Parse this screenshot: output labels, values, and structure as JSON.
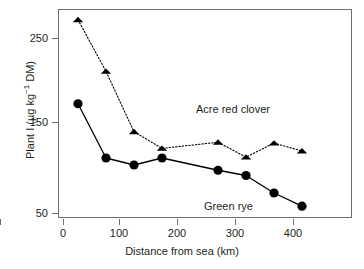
{
  "chart_data": {
    "type": "line",
    "title": "",
    "subtitle": "",
    "xlabel": "Distance from sea (km)",
    "ylabel": "Plant I (µg kg⁻¹ DM)",
    "ylabel_parts": {
      "prefix": "Plant I (µg kg",
      "superscript": "−1",
      "suffix": " DM)"
    },
    "xlim": [
      -15,
      440
    ],
    "ylim": [
      40,
      289
    ],
    "xticks": [
      0,
      100,
      200,
      300,
      400
    ],
    "xtick_labels": [
      "0",
      "100",
      "200",
      "300",
      "400"
    ],
    "yticks": [
      50,
      150,
      250
    ],
    "ytick_labels": [
      "50",
      "150",
      "250"
    ],
    "grid": false,
    "legend_position": "inline-annotations",
    "frame": "box",
    "series": [
      {
        "name": "Acre red clover",
        "marker": "triangle",
        "linestyle": "dotted",
        "color": "#000000",
        "annotation": "Acre red clover",
        "x": [
          25,
          75,
          125,
          175,
          275,
          325,
          375,
          425
        ],
        "values": [
          272,
          213,
          144,
          125,
          132,
          115,
          131,
          122
        ]
      },
      {
        "name": "Green rye",
        "marker": "circle",
        "linestyle": "solid",
        "color": "#000000",
        "annotation": "Green rye",
        "x": [
          25,
          75,
          125,
          175,
          275,
          325,
          375,
          425
        ],
        "values": [
          176,
          114,
          106,
          114,
          100,
          94,
          74,
          59
        ]
      }
    ]
  }
}
